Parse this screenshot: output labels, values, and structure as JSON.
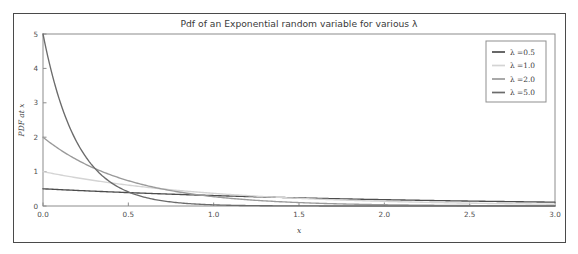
{
  "figure": {
    "border_color": "#4a4a4a",
    "background": "#ffffff"
  },
  "chart_data": {
    "type": "line",
    "title": "Pdf of an Exponential random variable for various λ",
    "xlabel": "x",
    "ylabel": "PDF at x",
    "xlim": [
      0.0,
      3.0
    ],
    "ylim": [
      0.0,
      5.0
    ],
    "grid": false,
    "legend_position": "upper right",
    "xticks": [
      0.0,
      0.5,
      1.0,
      1.5,
      2.0,
      2.5,
      3.0
    ],
    "xtick_labels": [
      "0.0",
      "0.5",
      "1.0",
      "1.5",
      "2.0",
      "2.5",
      "3.0"
    ],
    "yticks": [
      0,
      1,
      2,
      3,
      4,
      5
    ],
    "ytick_labels": [
      "0",
      "1",
      "2",
      "3",
      "4",
      "5"
    ],
    "x": [
      0.0,
      0.1,
      0.2,
      0.3,
      0.4,
      0.5,
      0.6,
      0.7,
      0.8,
      0.9,
      1.0,
      1.1,
      1.2,
      1.3,
      1.4,
      1.5,
      1.6,
      1.7,
      1.8,
      1.9,
      2.0,
      2.1,
      2.2,
      2.3,
      2.4,
      2.5,
      2.6,
      2.7,
      2.8,
      2.9,
      3.0
    ],
    "series": [
      {
        "name": "λ =0.5",
        "lambda": 0.5,
        "color": "#4d4d4d",
        "values": [
          0.5,
          0.4756,
          0.4524,
          0.4303,
          0.4094,
          0.3894,
          0.3704,
          0.3523,
          0.3351,
          0.3188,
          0.3033,
          0.2885,
          0.2744,
          0.261,
          0.2483,
          0.2362,
          0.2247,
          0.2137,
          0.2033,
          0.1934,
          0.1839,
          0.1749,
          0.1664,
          0.1583,
          0.1506,
          0.1433,
          0.1363,
          0.1296,
          0.1233,
          0.1173,
          0.1116
        ]
      },
      {
        "name": "λ =1.0",
        "lambda": 1.0,
        "color": "#d4d4d4",
        "values": [
          1.0,
          0.9048,
          0.8187,
          0.7408,
          0.6703,
          0.6065,
          0.5488,
          0.4966,
          0.4493,
          0.4066,
          0.3679,
          0.3329,
          0.3012,
          0.2725,
          0.2466,
          0.2231,
          0.2019,
          0.1827,
          0.1653,
          0.1496,
          0.1353,
          0.1225,
          0.1108,
          0.1003,
          0.0907,
          0.0821,
          0.0743,
          0.0672,
          0.0608,
          0.055,
          0.0498
        ]
      },
      {
        "name": "λ =2.0",
        "lambda": 2.0,
        "color": "#9a9a9a",
        "values": [
          2.0,
          1.6375,
          1.3406,
          1.0976,
          0.8987,
          0.7358,
          0.6024,
          0.4932,
          0.4038,
          0.3306,
          0.2707,
          0.2216,
          0.1814,
          0.1485,
          0.1216,
          0.0996,
          0.0815,
          0.0667,
          0.0546,
          0.0447,
          0.0366,
          0.03,
          0.0246,
          0.0201,
          0.0165,
          0.0135,
          0.011,
          0.009,
          0.0074,
          0.0061,
          0.005
        ]
      },
      {
        "name": "λ =5.0",
        "lambda": 5.0,
        "color": "#6b6b6b",
        "values": [
          5.0,
          3.0327,
          1.8394,
          1.1157,
          0.6767,
          0.4104,
          0.2489,
          0.151,
          0.0916,
          0.0555,
          0.0337,
          0.0204,
          0.0124,
          0.0075,
          0.0046,
          0.0028,
          0.0017,
          0.001,
          0.0006,
          0.0004,
          0.0002,
          0.0001,
          0.0001,
          0.0001,
          0.0,
          0.0,
          0.0,
          0.0,
          0.0,
          0.0,
          0.0
        ]
      }
    ]
  }
}
